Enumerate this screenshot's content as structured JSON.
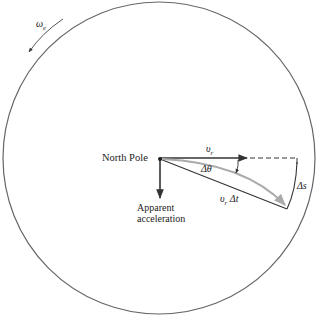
{
  "diagram": {
    "labels": {
      "omega": "ω",
      "omega_sub": "e",
      "north_pole": "North Pole",
      "vr": "υ",
      "vr_sub": "r",
      "delta_theta": "Δθ",
      "vr_dt": "υ",
      "vr_dt_sub": "r",
      "vr_dt_rest": " Δt",
      "delta_s": "Δs",
      "apparent_line1": "Apparent",
      "apparent_line2": "acceleration"
    },
    "colors": {
      "line": "#333333",
      "curve": "#aaaaaa",
      "circle": "#666666"
    }
  }
}
